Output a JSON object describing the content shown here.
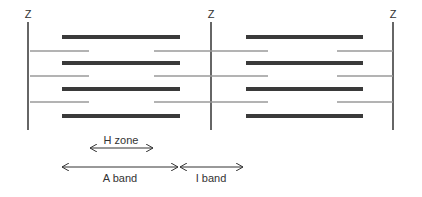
{
  "diagram": {
    "z_label": "Z",
    "z_lines": [
      {
        "x": 28,
        "label": "Z"
      },
      {
        "x": 211,
        "label": "Z"
      },
      {
        "x": 393,
        "label": "Z"
      }
    ],
    "thick_filaments": {
      "color": "#3a3a3a",
      "rows_y": [
        37,
        63,
        89,
        116
      ],
      "segments": [
        [
          62,
          180
        ],
        [
          246,
          363
        ]
      ]
    },
    "thin_filaments": {
      "color": "#9a9a9a",
      "rows_y": [
        51,
        76,
        102
      ],
      "segments": [
        [
          30,
          89
        ],
        [
          154,
          268
        ],
        [
          337,
          393
        ]
      ]
    },
    "annotations": {
      "h_zone": {
        "label": "H zone",
        "x1": 89,
        "x2": 154,
        "y": 148
      },
      "a_band": {
        "label": "A band",
        "x1": 61,
        "x2": 179,
        "y": 167
      },
      "i_band": {
        "label": "I band",
        "x1": 179,
        "x2": 244,
        "y": 167
      }
    }
  }
}
